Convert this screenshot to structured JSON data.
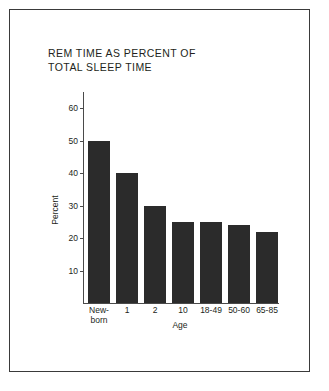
{
  "figure": {
    "background_color": "#ffffff",
    "frame_color": "#3a3a3a",
    "bar_color": "#2b2b2b",
    "axis_color": "#4a4a4a"
  },
  "chart_data": {
    "type": "bar",
    "title": "REM TIME AS PERCENT OF\nTOTAL SLEEP TIME",
    "xlabel": "Age",
    "ylabel": "Percent",
    "categories": [
      "New-\nborn",
      "1",
      "2",
      "10",
      "18-49",
      "50-60",
      "65-85"
    ],
    "values": [
      50,
      40,
      30,
      25,
      25,
      24,
      22
    ],
    "ylim": [
      0,
      65
    ],
    "yticks": [
      10,
      20,
      30,
      40,
      50,
      60
    ],
    "ytick_labels": [
      "10",
      "20",
      "30",
      "40",
      "50",
      "60"
    ],
    "grid": false,
    "legend": false
  }
}
